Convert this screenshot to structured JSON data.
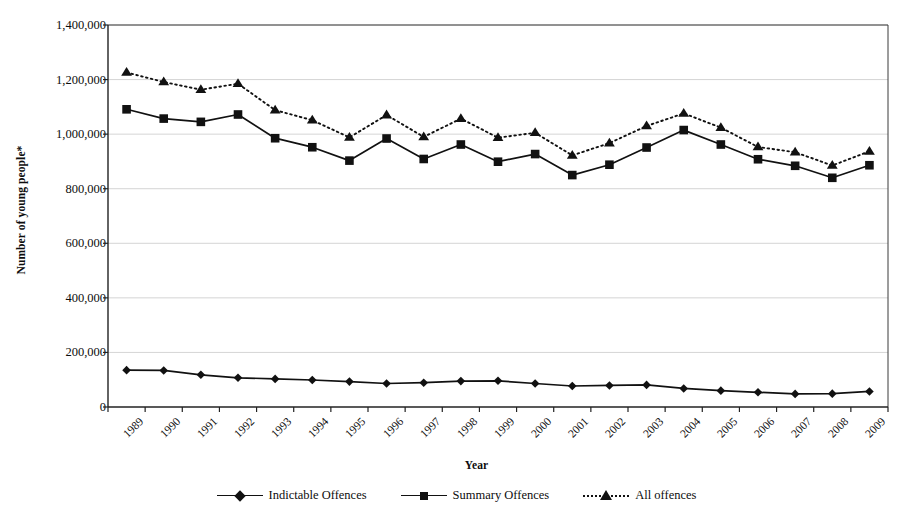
{
  "chart_data": {
    "type": "line",
    "title": "",
    "xlabel": "Year",
    "ylabel": "Number of young people*",
    "categories": [
      "1989",
      "1990",
      "1991",
      "1992",
      "1993",
      "1994",
      "1995",
      "1996",
      "1997",
      "1998",
      "1999",
      "2000",
      "2001",
      "2002",
      "2003",
      "2004",
      "2005",
      "2006",
      "2007",
      "2008",
      "2009"
    ],
    "ylim": [
      0,
      1400000
    ],
    "yticks": [
      "0",
      "200,000",
      "400,000",
      "600,000",
      "800,000",
      "1,000,000",
      "1,200,000",
      "1,400,000"
    ],
    "ytick_values": [
      0,
      200000,
      400000,
      600000,
      800000,
      1000000,
      1200000,
      1400000
    ],
    "grid": true,
    "legend_position": "bottom",
    "series": [
      {
        "name": "Indictable Offences",
        "marker": "diamond",
        "line": "solid",
        "color": "#111111",
        "values": [
          135000,
          134000,
          118000,
          107000,
          103000,
          99000,
          93000,
          86000,
          89000,
          95000,
          96000,
          86000,
          77000,
          79000,
          81000,
          68000,
          60000,
          54000,
          48000,
          49000,
          57000
        ]
      },
      {
        "name": "Summary Offences",
        "marker": "square",
        "line": "solid",
        "color": "#111111",
        "values": [
          1091000,
          1057000,
          1045000,
          1072000,
          985000,
          952000,
          903000,
          984000,
          909000,
          962000,
          899000,
          927000,
          850000,
          888000,
          951000,
          1015000,
          962000,
          908000,
          884000,
          840000,
          886000
        ]
      },
      {
        "name": "All offences",
        "marker": "triangle",
        "line": "dotted",
        "color": "#111111",
        "values": [
          1226000,
          1191000,
          1163000,
          1185000,
          1088000,
          1051000,
          988000,
          1070000,
          990000,
          1057000,
          987000,
          1005000,
          922000,
          967000,
          1030000,
          1076000,
          1024000,
          953000,
          934000,
          885000,
          937000
        ]
      }
    ]
  },
  "legend": {
    "items": [
      {
        "label": "Indictable Offences",
        "marker": "diamond-marker",
        "line": "solid"
      },
      {
        "label": "Summary Offences",
        "marker": "square-marker",
        "line": "solid"
      },
      {
        "label": "All offences",
        "marker": "triangle-marker",
        "line": "dotted"
      }
    ]
  },
  "colors": {
    "ink": "#111111",
    "grid": "#c9c9c9",
    "axis": "#3a3a3a",
    "background": "#ffffff"
  }
}
